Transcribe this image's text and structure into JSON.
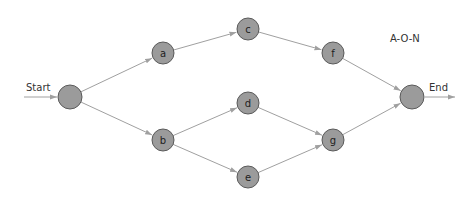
{
  "diagram": {
    "title": "A-O-N",
    "start_label": "Start",
    "end_label": "End",
    "colors": {
      "node_fill": "#9b9b9b",
      "node_stroke": "#5a5a5a",
      "edge": "#a0a0a0",
      "text": "#222222"
    },
    "nodes": [
      {
        "id": "start",
        "label": "",
        "x": 70,
        "y": 97,
        "r": 12
      },
      {
        "id": "a",
        "label": "a",
        "x": 163,
        "y": 53,
        "r": 11
      },
      {
        "id": "b",
        "label": "b",
        "x": 163,
        "y": 140,
        "r": 11
      },
      {
        "id": "c",
        "label": "c",
        "x": 248,
        "y": 29,
        "r": 11
      },
      {
        "id": "d",
        "label": "d",
        "x": 248,
        "y": 103,
        "r": 11
      },
      {
        "id": "e",
        "label": "e",
        "x": 248,
        "y": 177,
        "r": 11
      },
      {
        "id": "f",
        "label": "f",
        "x": 333,
        "y": 53,
        "r": 11
      },
      {
        "id": "g",
        "label": "g",
        "x": 333,
        "y": 140,
        "r": 11
      },
      {
        "id": "end",
        "label": "",
        "x": 412,
        "y": 97,
        "r": 12
      }
    ],
    "edges": [
      {
        "from": "start",
        "to": "a"
      },
      {
        "from": "start",
        "to": "b"
      },
      {
        "from": "a",
        "to": "c"
      },
      {
        "from": "b",
        "to": "d"
      },
      {
        "from": "b",
        "to": "e"
      },
      {
        "from": "c",
        "to": "f"
      },
      {
        "from": "d",
        "to": "g"
      },
      {
        "from": "e",
        "to": "g"
      },
      {
        "from": "f",
        "to": "end"
      },
      {
        "from": "g",
        "to": "end"
      }
    ]
  }
}
